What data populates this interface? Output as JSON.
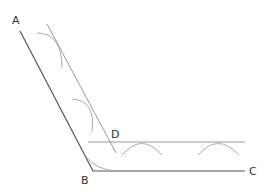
{
  "diagram": {
    "points": {
      "A": {
        "label": "A",
        "x": 20,
        "y": 31
      },
      "B": {
        "label": "B",
        "x": 93,
        "y": 171
      },
      "C": {
        "label": "C",
        "x": 245,
        "y": 171
      },
      "D": {
        "label": "D",
        "x": 113,
        "y": 143
      }
    },
    "labels": [
      {
        "id": "A",
        "text": "A",
        "x": 12,
        "y": 24
      },
      {
        "id": "B",
        "text": "B",
        "x": 81,
        "y": 184
      },
      {
        "id": "C",
        "text": "C",
        "x": 249,
        "y": 175
      },
      {
        "id": "D",
        "text": "D",
        "x": 111,
        "y": 138
      }
    ],
    "colors": {
      "main_line": "#555555",
      "construction_line": "#999999",
      "arc": "#aaaaaa",
      "label": "#333333"
    }
  }
}
